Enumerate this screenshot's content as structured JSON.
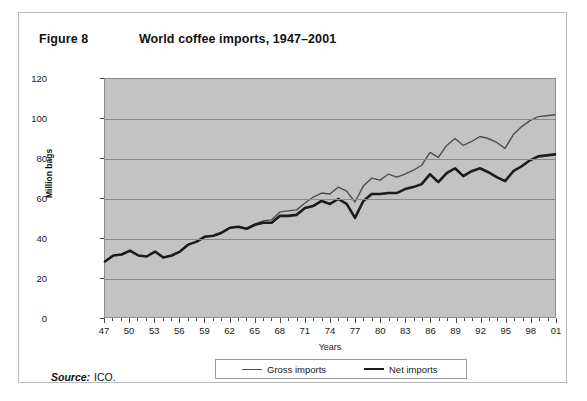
{
  "figure": {
    "number": "Figure 8",
    "title": "World coffee imports, 1947–2001"
  },
  "source": {
    "label": "Source:",
    "value": "ICO."
  },
  "legend": {
    "gross_label": "Gross imports",
    "net_label": "Net imports"
  },
  "colors": {
    "plot_background": "#c3c3c3",
    "gridline": "#8a8a8a",
    "gross_line": "#4d4d4d",
    "net_line": "#1b1b1b",
    "border": "#b9b9b9"
  },
  "chart_data": {
    "type": "line",
    "title": "World coffee imports, 1947–2001",
    "xlabel": "Years",
    "ylabel": "Million bags",
    "ylim": [
      0,
      120
    ],
    "yticks": [
      0,
      20,
      40,
      60,
      80,
      100,
      120
    ],
    "xlim": [
      1947,
      2001
    ],
    "xtick_labels": [
      "47",
      "50",
      "53",
      "56",
      "59",
      "62",
      "65",
      "68",
      "71",
      "74",
      "77",
      "80",
      "83",
      "86",
      "89",
      "92",
      "95",
      "98",
      "01"
    ],
    "xtick_years": [
      1947,
      1950,
      1953,
      1956,
      1959,
      1962,
      1965,
      1968,
      1971,
      1974,
      1977,
      1980,
      1983,
      1986,
      1989,
      1992,
      1995,
      1998,
      2001
    ],
    "grid": true,
    "legend_position": "bottom",
    "x": [
      1947,
      1948,
      1949,
      1950,
      1951,
      1952,
      1953,
      1954,
      1955,
      1956,
      1957,
      1958,
      1959,
      1960,
      1961,
      1962,
      1963,
      1964,
      1965,
      1966,
      1967,
      1968,
      1969,
      1970,
      1971,
      1972,
      1973,
      1974,
      1975,
      1976,
      1977,
      1978,
      1979,
      1980,
      1981,
      1982,
      1983,
      1984,
      1985,
      1986,
      1987,
      1988,
      1989,
      1990,
      1991,
      1992,
      1993,
      1994,
      1995,
      1996,
      1997,
      1998,
      1999,
      2000,
      2001
    ],
    "series": [
      {
        "name": "Gross imports",
        "values": [
          28,
          31,
          31.5,
          33.5,
          31,
          30.5,
          33,
          30,
          31,
          33,
          36.5,
          38,
          40.5,
          41,
          42.5,
          45,
          45.5,
          44.5,
          47,
          48.5,
          49,
          53,
          53.5,
          54,
          57.5,
          60.5,
          62.5,
          62,
          65.5,
          63.5,
          58,
          66,
          70,
          69,
          72,
          70.5,
          72,
          74,
          76.5,
          83,
          80.5,
          86.5,
          90,
          86.5,
          88.5,
          91,
          90,
          88,
          85,
          92,
          96,
          99,
          101,
          101.5,
          102
        ]
      },
      {
        "name": "Net imports",
        "values": [
          28,
          31,
          31.5,
          33.5,
          31,
          30.5,
          33,
          30,
          31,
          33,
          36.5,
          38,
          40.5,
          41,
          42.5,
          45,
          45.5,
          44.5,
          46.5,
          47.5,
          47.5,
          51,
          51,
          51.5,
          55,
          56,
          58.5,
          57,
          59.5,
          57,
          50,
          58.5,
          62,
          62,
          62.5,
          62.5,
          64.5,
          65.5,
          67,
          72,
          68,
          72.5,
          75,
          71,
          73.5,
          75,
          73,
          70.5,
          68.5,
          73.5,
          76,
          79,
          81,
          81.5,
          82
        ]
      }
    ]
  }
}
